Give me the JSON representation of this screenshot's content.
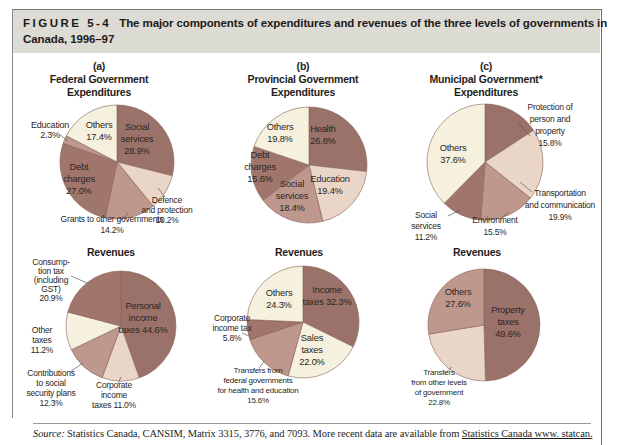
{
  "header": {
    "figure_label": "FIGURE 5-4",
    "title_line1": "The major components of expenditures and revenues of the three levels of governments in",
    "title_line2": "Canada, 1996–97"
  },
  "source": {
    "prefix": "Source:",
    "text": " Statistics Canada, CANSIM, Matrix 3315, 3776, and 7093. More recent data are available from ",
    "link": "Statistics Canada www. statcan."
  },
  "palette": {
    "dark": "#9b7269",
    "dark2": "#a0766c",
    "medium": "#bf988d",
    "lightpink": "#ead5c9",
    "cream": "#f5f1de",
    "slice_stroke": "#846158",
    "leader": "#5a5a5a",
    "header_bg": "#dcdbd4"
  },
  "chart_data": [
    {
      "id": "federal-expenditures",
      "type": "pie",
      "units": "percent",
      "title_lines": [
        "(a)",
        "Federal Government",
        "Expenditures"
      ],
      "box": {
        "left": 15,
        "top": 56,
        "width": 200,
        "height": 187
      },
      "pie": {
        "cx": 102,
        "cy": 106,
        "r": 57
      },
      "title_pos": {
        "x": 84,
        "y": 14,
        "line_h": 13
      },
      "slices": [
        {
          "label": "Social services",
          "value": 28.9,
          "shade": "dark",
          "inside": true,
          "lines": [
            "Social",
            "services",
            "28.9%"
          ],
          "lx": 122,
          "ly": 74
        },
        {
          "label": "Defence and protection",
          "value": 10.2,
          "shade": "lightpink",
          "inside": false,
          "lines": [
            "Defence",
            "and protection",
            "10.2%"
          ],
          "lx": 152,
          "ly": 147,
          "leader": [
            143,
            132,
            150,
            141
          ]
        },
        {
          "label": "Grants to other governments",
          "value": 14.2,
          "shade": "medium",
          "inside": false,
          "lines": [
            "Grants to other governments",
            "14.2%"
          ],
          "lx": 97,
          "ly": 166,
          "lh": 11,
          "leader": [
            113,
            157,
            107,
            164
          ]
        },
        {
          "label": "Debt charges",
          "value": 27.0,
          "shade": "dark2",
          "inside": true,
          "lines": [
            "Debt",
            "charges",
            "27.0%"
          ],
          "lx": 64,
          "ly": 114
        },
        {
          "label": "Education",
          "value": 2.3,
          "shade": "medium",
          "inside": false,
          "lines": [
            "Education",
            "2.3%"
          ],
          "lx": 35,
          "ly": 72,
          "fs": 9,
          "leader": [
            53,
            85,
            44,
            78
          ]
        },
        {
          "label": "Others",
          "value": 17.4,
          "shade": "cream",
          "inside": true,
          "lines": [
            "Others",
            "17.4%"
          ],
          "lx": 84,
          "ly": 72
        }
      ]
    },
    {
      "id": "provincial-expenditures",
      "type": "pie",
      "units": "percent",
      "title_lines": [
        "(b)",
        "Provincial Government",
        "Expenditures"
      ],
      "box": {
        "left": 212,
        "top": 56,
        "width": 200,
        "height": 187
      },
      "pie": {
        "cx": 97,
        "cy": 109,
        "r": 58
      },
      "title_pos": {
        "x": 91,
        "y": 14,
        "line_h": 13
      },
      "slices": [
        {
          "label": "Health",
          "value": 26.8,
          "shade": "dark",
          "inside": true,
          "lines": [
            "Health",
            "26.8%"
          ],
          "lx": 111,
          "ly": 76
        },
        {
          "label": "Education",
          "value": 19.4,
          "shade": "lightpink",
          "inside": true,
          "lines": [
            "Education",
            "19.4%"
          ],
          "lx": 118,
          "ly": 126
        },
        {
          "label": "Social services",
          "value": 18.4,
          "shade": "medium",
          "inside": true,
          "lines": [
            "Social",
            "services",
            "18.4%"
          ],
          "lx": 80,
          "ly": 131
        },
        {
          "label": "Debt charges",
          "value": 15.6,
          "shade": "dark2",
          "inside": true,
          "lines": [
            "Debt",
            "charges",
            "15.6%"
          ],
          "lx": 48,
          "ly": 102
        },
        {
          "label": "Others",
          "value": 19.8,
          "shade": "cream",
          "inside": true,
          "lines": [
            "Others",
            "19.8%"
          ],
          "lx": 68,
          "ly": 74
        }
      ]
    },
    {
      "id": "municipal-expenditures",
      "type": "pie",
      "units": "percent",
      "title_lines": [
        "(c)",
        "Municipal Government*",
        "Expenditures"
      ],
      "box": {
        "left": 408,
        "top": 56,
        "width": 207,
        "height": 190
      },
      "pie": {
        "cx": 77,
        "cy": 106,
        "r": 58
      },
      "title_pos": {
        "x": 78,
        "y": 14,
        "line_h": 13
      },
      "slices": [
        {
          "label": "Protection of person and property",
          "value": 15.8,
          "shade": "dark",
          "inside": false,
          "lines": [
            "Protection of",
            "person and",
            "property",
            "15.8%"
          ],
          "lx": 142,
          "ly": 54,
          "lh": 12,
          "leader": [
            110,
            66,
            122,
            80
          ]
        },
        {
          "label": "Transportation and communication",
          "value": 19.9,
          "shade": "lightpink",
          "inside": false,
          "lines": [
            "Transportation",
            "and communication",
            "19.9%"
          ],
          "lx": 152,
          "ly": 140,
          "lh": 12,
          "leader": [
            112,
            126,
            124,
            136
          ]
        },
        {
          "label": "Environment",
          "value": 15.5,
          "shade": "medium",
          "inside": false,
          "lines": [
            "Environment",
            "15.5%"
          ],
          "lx": 87,
          "ly": 167,
          "lh": 12,
          "leader": [
            100,
            156,
            92,
            164
          ]
        },
        {
          "label": "Social services",
          "value": 11.2,
          "shade": "dark2",
          "inside": false,
          "lines": [
            "Social",
            "services",
            "11.2%"
          ],
          "lx": 18,
          "ly": 162,
          "lh": 11,
          "leader": [
            52,
            154,
            40,
            160
          ]
        },
        {
          "label": "Others",
          "value": 37.6,
          "shade": "cream",
          "inside": true,
          "lines": [
            "Others",
            "37.6%"
          ],
          "lx": 45,
          "ly": 95
        }
      ]
    },
    {
      "id": "federal-revenues",
      "type": "pie",
      "units": "percent",
      "title_lines": [
        "Revenues"
      ],
      "box": {
        "left": 15,
        "top": 243,
        "width": 200,
        "height": 180
      },
      "pie": {
        "cx": 106,
        "cy": 83,
        "r": 55
      },
      "title_pos": {
        "x": 96,
        "y": 13,
        "line_h": 13
      },
      "slices": [
        {
          "label": "Personal income taxes",
          "value": 44.6,
          "shade": "dark",
          "inside": true,
          "lines": [
            "Personal",
            "income",
            "taxes 44.6%"
          ],
          "lx": 128,
          "ly": 66
        },
        {
          "label": "Corporate income taxes",
          "value": 11.0,
          "shade": "lightpink",
          "inside": false,
          "lines": [
            "Corporate",
            "income",
            "taxes 11.0%"
          ],
          "lx": 99,
          "ly": 145,
          "leader": [
            106,
            134,
            103,
            141
          ]
        },
        {
          "label": "Contributions to social security plans",
          "value": 12.3,
          "shade": "medium",
          "inside": false,
          "lines": [
            "Contributions",
            "to social",
            "security plans",
            "12.3%"
          ],
          "lx": 36,
          "ly": 133,
          "leader": [
            68,
            120,
            55,
            129
          ]
        },
        {
          "label": "Other taxes",
          "value": 11.2,
          "shade": "cream",
          "inside": false,
          "lines": [
            "Other",
            "taxes",
            "11.2%"
          ],
          "lx": 27,
          "ly": 90
        },
        {
          "label": "Consumption tax (including GST)",
          "value": 20.9,
          "shade": "dark2",
          "inside": false,
          "lines": [
            "Consump-",
            "tion tax",
            "(including",
            "GST)",
            "20.9%"
          ],
          "lx": 36,
          "ly": 22,
          "lh": 9,
          "leader": [
            72,
            40,
            56,
            33
          ]
        }
      ]
    },
    {
      "id": "provincial-revenues",
      "type": "pie",
      "units": "percent",
      "title_lines": [
        "Revenues"
      ],
      "box": {
        "left": 212,
        "top": 243,
        "width": 200,
        "height": 180
      },
      "pie": {
        "cx": 91,
        "cy": 79,
        "r": 56
      },
      "title_pos": {
        "x": 87,
        "y": 13,
        "line_h": 13
      },
      "slices": [
        {
          "label": "Income taxes",
          "value": 32.3,
          "shade": "dark",
          "inside": true,
          "lines": [
            "Income",
            "taxes 32.3%"
          ],
          "lx": 115,
          "ly": 50
        },
        {
          "label": "Sales taxes",
          "value": 22.0,
          "shade": "cream",
          "inside": true,
          "lines": [
            "Sales",
            "taxes",
            "22.0%"
          ],
          "lx": 100,
          "ly": 98
        },
        {
          "label": "Transfers from federal governments for health and education",
          "value": 15.6,
          "shade": "medium",
          "inside": false,
          "lines": [
            "Transfers from",
            "federal governments",
            "for health and education",
            "15.6%"
          ],
          "lx": 46,
          "ly": 130,
          "fs": 8,
          "leader": [
            52,
            118,
            47,
            126
          ]
        },
        {
          "label": "Corporate income tax",
          "value": 5.8,
          "shade": "dark2",
          "inside": false,
          "lines": [
            "Corporate",
            "income tax",
            "5.8%"
          ],
          "lx": 20,
          "ly": 78,
          "leader": [
            37,
            93,
            30,
            90
          ]
        },
        {
          "label": "Others",
          "value": 24.3,
          "shade": "cream",
          "inside": true,
          "lines": [
            "Others",
            "24.3%"
          ],
          "lx": 67,
          "ly": 53
        }
      ]
    },
    {
      "id": "municipal-revenues",
      "type": "pie",
      "units": "percent",
      "title_lines": [
        "Revenues"
      ],
      "box": {
        "left": 408,
        "top": 243,
        "width": 200,
        "height": 180
      },
      "pie": {
        "cx": 76,
        "cy": 82,
        "r": 56
      },
      "title_pos": {
        "x": 69,
        "y": 13,
        "line_h": 13
      },
      "slices": [
        {
          "label": "Property taxes",
          "value": 49.6,
          "shade": "dark",
          "inside": true,
          "lines": [
            "Property",
            "taxes",
            "49.6%"
          ],
          "lx": 100,
          "ly": 70
        },
        {
          "label": "Transfers from other levels of government",
          "value": 22.8,
          "shade": "lightpink",
          "inside": false,
          "lines": [
            "Transfers",
            "from other levels",
            "of government",
            "22.8%"
          ],
          "lx": 31,
          "ly": 132,
          "fs": 8,
          "leader": [
            44,
            124,
            36,
            131
          ]
        },
        {
          "label": "Others",
          "value": 27.6,
          "shade": "medium",
          "inside": true,
          "lines": [
            "Others",
            "27.6%"
          ],
          "lx": 50,
          "ly": 52
        }
      ]
    }
  ]
}
